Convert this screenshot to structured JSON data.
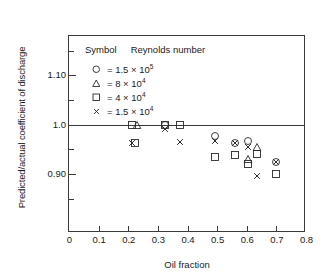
{
  "chart_data": {
    "type": "scatter",
    "title": "",
    "xlabel": "Oil fraction",
    "ylabel": "Predicted/actual coefficient of discharge",
    "xlim": [
      0,
      0.8
    ],
    "ylim": [
      0.78,
      1.18
    ],
    "grid": false,
    "reference_line": 1.0,
    "xticks": [
      "0",
      "0.1",
      "0.2",
      "0.3",
      "0.4",
      "0.5",
      "0.6",
      "0.7",
      "0.8"
    ],
    "xtick_values": [
      0,
      0.1,
      0.2,
      0.3,
      0.4,
      0.5,
      0.6,
      0.7,
      0.8
    ],
    "yticks": [
      "1.10",
      "1.0",
      "0.90"
    ],
    "ytick_values": [
      1.1,
      1.0,
      0.9
    ],
    "yminor_values": [
      1.15,
      1.05,
      0.95,
      0.85
    ],
    "legend": {
      "position": "top-left",
      "col1_header": "Symbol",
      "col2_header": "Reynolds number",
      "entries": [
        {
          "symbol": "circle",
          "equals": "=",
          "mantissa": "1.5",
          "times": "×",
          "base": "10",
          "exponent": "5",
          "label": "= 1.5 × 10⁵"
        },
        {
          "symbol": "triangle",
          "equals": "=",
          "mantissa": "8",
          "times": "×",
          "base": "10",
          "exponent": "4",
          "label": "= 8 × 10⁴"
        },
        {
          "symbol": "square",
          "equals": "=",
          "mantissa": "4",
          "times": "×",
          "base": "10",
          "exponent": "4",
          "label": "= 4 × 10⁴"
        },
        {
          "symbol": "cross",
          "equals": "=",
          "mantissa": "1.5",
          "times": "×",
          "base": "10",
          "exponent": "4",
          "label": "= 1.5 × 10⁴"
        }
      ]
    },
    "series": [
      {
        "name": "1.5 × 10⁵",
        "symbol": "circle",
        "points": [
          {
            "x": 0.323,
            "y": 1.0
          },
          {
            "x": 0.492,
            "y": 0.977
          },
          {
            "x": 0.56,
            "y": 0.962
          },
          {
            "x": 0.605,
            "y": 0.966
          },
          {
            "x": 0.7,
            "y": 0.924
          }
        ]
      },
      {
        "name": "8 × 10⁴",
        "symbol": "triangle",
        "points": [
          {
            "x": 0.228,
            "y": 1.0
          },
          {
            "x": 0.605,
            "y": 0.93
          },
          {
            "x": 0.636,
            "y": 0.955
          }
        ]
      },
      {
        "name": "4 × 10⁴",
        "symbol": "square",
        "points": [
          {
            "x": 0.213,
            "y": 0.999
          },
          {
            "x": 0.222,
            "y": 0.963
          },
          {
            "x": 0.323,
            "y": 1.0
          },
          {
            "x": 0.374,
            "y": 1.0
          },
          {
            "x": 0.492,
            "y": 0.935
          },
          {
            "x": 0.56,
            "y": 0.938
          },
          {
            "x": 0.605,
            "y": 0.92
          },
          {
            "x": 0.636,
            "y": 0.94
          },
          {
            "x": 0.7,
            "y": 0.9
          }
        ]
      },
      {
        "name": "1.5 × 10⁴",
        "symbol": "cross",
        "points": [
          {
            "x": 0.213,
            "y": 0.963
          },
          {
            "x": 0.323,
            "y": 0.992
          },
          {
            "x": 0.374,
            "y": 0.965
          },
          {
            "x": 0.492,
            "y": 0.967
          },
          {
            "x": 0.56,
            "y": 0.962
          },
          {
            "x": 0.605,
            "y": 0.955
          },
          {
            "x": 0.636,
            "y": 0.895
          },
          {
            "x": 0.7,
            "y": 0.924
          }
        ]
      }
    ]
  }
}
